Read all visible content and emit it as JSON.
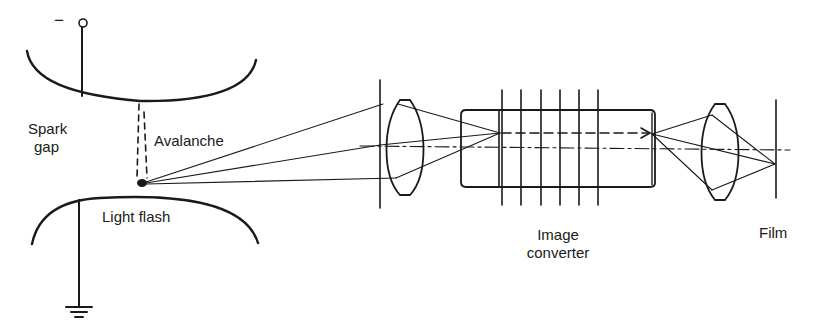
{
  "figure": {
    "labels": {
      "terminal_sign": "−",
      "spark_gap_line1": "Spark",
      "spark_gap_line2": "gap",
      "avalanche": "Avalanche",
      "light_flash": "Light flash",
      "image_converter_line1": "Image",
      "image_converter_line2": "converter",
      "film": "Film"
    },
    "colors": {
      "stroke": "#1a1a1a",
      "background": "#ffffff"
    },
    "components": [
      "negative-terminal",
      "top-electrode",
      "avalanche",
      "light-flash",
      "bottom-electrode",
      "ground",
      "objective-lens",
      "image-converter",
      "relay-lens",
      "film"
    ]
  }
}
